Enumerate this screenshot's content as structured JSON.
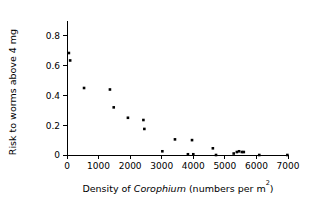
{
  "chart_data": {
    "type": "scatter",
    "title": "",
    "xlabel": "Density of Corophium (numbers per m2)",
    "xlabel_parts": {
      "prefix": "Density of ",
      "species": "Corophium",
      "middle": " (numbers per m",
      "superscript": "2",
      "suffix": ")"
    },
    "ylabel": "Risk to worms above 4 mg",
    "xlim": [
      0,
      7000
    ],
    "ylim": [
      0,
      0.9
    ],
    "xticks": [
      0,
      1000,
      2000,
      3000,
      4000,
      5000,
      6000,
      7000
    ],
    "xticklabels": [
      "0",
      "1000",
      "2000",
      "3000",
      "4000",
      "5000",
      "6000",
      "7000"
    ],
    "yticks": [
      0,
      0.2,
      0.4,
      0.6,
      0.8
    ],
    "yticklabels": [
      "0",
      "0.2",
      "0.4",
      "0.6",
      "0.8"
    ],
    "grid": false,
    "legend": null,
    "marker": "square",
    "marker_color": "#000000",
    "marker_size": 2.6,
    "x": [
      60,
      100,
      540,
      1360,
      1480,
      1930,
      2420,
      2450,
      3020,
      3420,
      3830,
      3960,
      4000,
      4620,
      4720,
      5280,
      5380,
      5450,
      5540,
      5600,
      6090,
      6980
    ],
    "y": [
      0.685,
      0.635,
      0.45,
      0.44,
      0.32,
      0.25,
      0.235,
      0.175,
      0.025,
      0.105,
      0.005,
      0.1,
      0.005,
      0.045,
      0.0,
      0.01,
      0.02,
      0.025,
      0.02,
      0.02,
      0.0,
      0.0
    ],
    "points": [
      {
        "x": 60,
        "y": 0.685
      },
      {
        "x": 100,
        "y": 0.635
      },
      {
        "x": 540,
        "y": 0.45
      },
      {
        "x": 1360,
        "y": 0.44
      },
      {
        "x": 1480,
        "y": 0.32
      },
      {
        "x": 1930,
        "y": 0.25
      },
      {
        "x": 2420,
        "y": 0.235
      },
      {
        "x": 2450,
        "y": 0.175
      },
      {
        "x": 3020,
        "y": 0.025
      },
      {
        "x": 3420,
        "y": 0.105
      },
      {
        "x": 3830,
        "y": 0.005
      },
      {
        "x": 3960,
        "y": 0.1
      },
      {
        "x": 4000,
        "y": 0.005
      },
      {
        "x": 4620,
        "y": 0.045
      },
      {
        "x": 4720,
        "y": 0.0
      },
      {
        "x": 5280,
        "y": 0.01
      },
      {
        "x": 5380,
        "y": 0.02
      },
      {
        "x": 5450,
        "y": 0.025
      },
      {
        "x": 5540,
        "y": 0.02
      },
      {
        "x": 5600,
        "y": 0.02
      },
      {
        "x": 6090,
        "y": 0.0
      },
      {
        "x": 6980,
        "y": 0.0
      }
    ]
  }
}
